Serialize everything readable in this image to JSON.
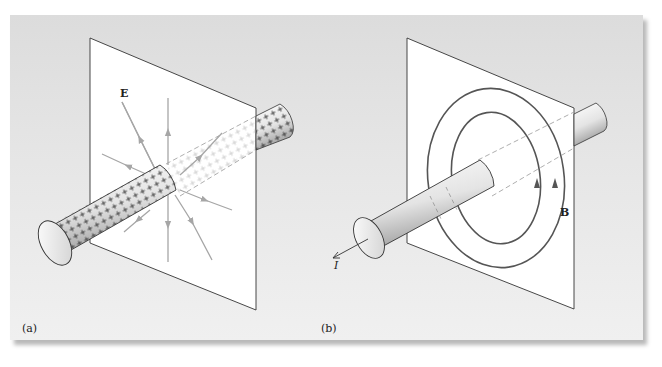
{
  "figure": {
    "panels": [
      {
        "label": "(a)",
        "description": "Uniformly charged long cylindrical rod passing through a plane; radial electric field lines",
        "field_label": "E",
        "charge_symbol": "+",
        "field_line_count": 8
      },
      {
        "label": "(b)",
        "description": "Long straight current-carrying wire passing through a plane; concentric magnetic field loops",
        "field_label": "B",
        "current_label": "I",
        "field_loop_count": 2
      }
    ],
    "colors": {
      "panel_background_top": "#dcdcdc",
      "panel_background_bottom": "#f0f0f0",
      "plane_fill": "#ffffff",
      "outline": "#333333",
      "field_line_gray": "#a6a6a6",
      "magnetic_loop": "#555555"
    }
  }
}
